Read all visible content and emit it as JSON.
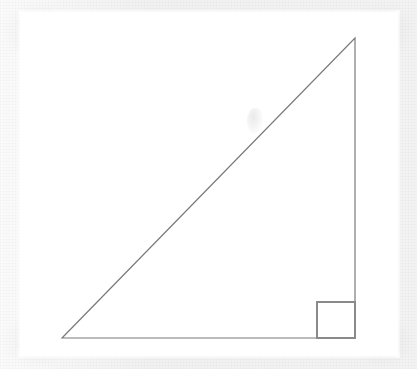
{
  "figure": {
    "caption": "",
    "canvas": {
      "width": 417,
      "height": 369,
      "background_color": "#f2f2f2",
      "paper_color": "#ffffff",
      "paper_rect": {
        "x": 20,
        "y": 12,
        "width": 378,
        "height": 344
      }
    },
    "style": {
      "stroke_color": "#7a7a7a",
      "stroke_width": 1.2,
      "fill": "none"
    },
    "shapes": {
      "triangle": {
        "name": "right-triangle",
        "type": "polygon",
        "points": "62,338 355,338 355,38",
        "vertices": [
          {
            "label": "bottom-left-vertex",
            "x": 62,
            "y": 338,
            "angle_deg": 45
          },
          {
            "label": "bottom-right-vertex",
            "x": 355,
            "y": 338,
            "angle_deg": 90
          },
          {
            "label": "apex-vertex",
            "x": 355,
            "y": 38,
            "angle_deg": 45
          }
        ],
        "edges": [
          {
            "label": "base-horizontal-leg",
            "from": "bottom-left-vertex",
            "to": "bottom-right-vertex",
            "length_px": 293
          },
          {
            "label": "vertical-leg",
            "from": "bottom-right-vertex",
            "to": "apex-vertex",
            "length_px": 300
          },
          {
            "label": "hypotenuse",
            "from": "apex-vertex",
            "to": "bottom-left-vertex",
            "length_px": 419
          }
        ]
      },
      "right_angle_marker": {
        "name": "right-angle-square",
        "type": "square",
        "at_vertex": "bottom-right-vertex",
        "x": 317,
        "y": 302,
        "width": 38,
        "height": 36
      }
    },
    "artifacts": [
      {
        "name": "scan-smudge",
        "type": "smudge",
        "x": 247,
        "y": 108,
        "width": 16,
        "height": 26
      }
    ]
  },
  "chart_data": {
    "type": "diagram",
    "xlabel": "",
    "ylabel": "",
    "legend": [],
    "annotations": [
      "right-angle-square at bottom-right vertex"
    ],
    "series": [
      {
        "name": "right-triangle-outline",
        "x": [
          62,
          355,
          355,
          62
        ],
        "y": [
          338,
          338,
          38,
          338
        ]
      },
      {
        "name": "right-angle-square",
        "x": [
          317,
          355,
          355,
          317,
          317
        ],
        "y": [
          338,
          338,
          302,
          302,
          338
        ]
      }
    ]
  }
}
